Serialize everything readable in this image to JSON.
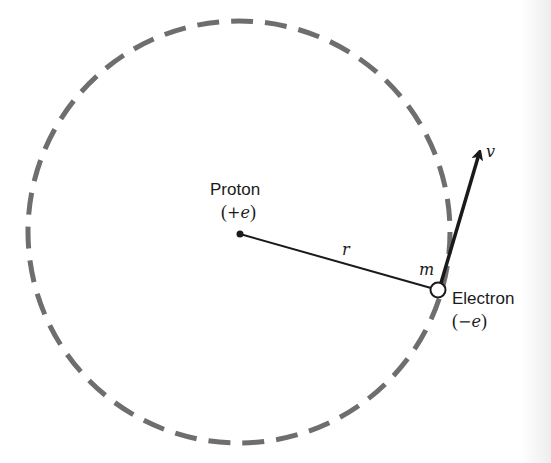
{
  "diagram": {
    "orbit": {
      "style": "dashed",
      "color": "#6e6e6e",
      "center": [
        239,
        232
      ],
      "radius": 211
    },
    "proton": {
      "label": "Proton",
      "charge_open": "(",
      "charge": "+e",
      "charge_close": ")",
      "position": [
        240,
        234
      ]
    },
    "electron": {
      "label": "Electron",
      "charge_open": "(",
      "charge": "−e",
      "charge_close": ")",
      "mass_label": "m",
      "position": [
        438,
        290
      ]
    },
    "radius_label": "r",
    "velocity_label": "v",
    "colors": {
      "ink": "#1a1a1a",
      "orbit": "#6e6e6e",
      "background": "#ffffff"
    }
  }
}
